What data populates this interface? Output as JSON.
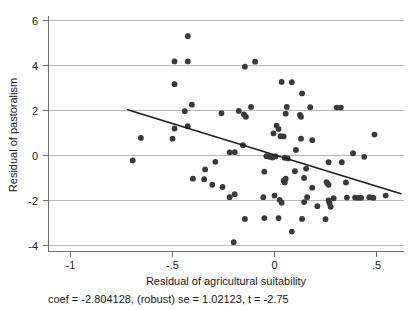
{
  "chart_data": {
    "type": "scatter",
    "title": "",
    "xlabel": "Residual of agricultural suitability",
    "ylabel": "Residual of pastoralism",
    "xlim": [
      -1.06,
      0.68
    ],
    "ylim": [
      -4.3,
      6.3
    ],
    "xticks": [
      -1,
      -0.5,
      0,
      0.5
    ],
    "xticklabels": [
      "-1",
      "-.5",
      "0",
      ".5"
    ],
    "yticks": [
      -4,
      -2,
      0,
      2,
      4,
      6
    ],
    "yticklabels": [
      "-4",
      "-2",
      "0",
      "2",
      "4",
      "6"
    ],
    "grid": "horizontal",
    "legend": "none",
    "annotation": "coef = -2.804128, (robust) se = 1.02123, t = -2.75",
    "fit_line": {
      "label": "linear fit",
      "slope": -2.804128,
      "x_start": -0.72,
      "y_start": 2.03,
      "x_end": 0.62,
      "y_end": -1.7
    },
    "point_color": "#3a3a3a",
    "gridline_color": "#b9b9b9",
    "axis_color": "#6e6e6e",
    "points": [
      [
        -0.425,
        5.3
      ],
      [
        -0.49,
        4.18
      ],
      [
        -0.425,
        4.18
      ],
      [
        -0.145,
        3.95
      ],
      [
        -0.095,
        4.17
      ],
      [
        -0.49,
        3.17
      ],
      [
        0.035,
        3.27
      ],
      [
        0.085,
        3.26
      ],
      [
        0.135,
        2.76
      ],
      [
        -0.405,
        2.26
      ],
      [
        -0.44,
        1.97
      ],
      [
        0.06,
        2.16
      ],
      [
        0.175,
        2.15
      ],
      [
        -0.115,
        2.16
      ],
      [
        0.305,
        2.13
      ],
      [
        0.325,
        2.13
      ],
      [
        -0.26,
        1.88
      ],
      [
        -0.175,
        1.98
      ],
      [
        -0.15,
        1.83
      ],
      [
        -0.14,
        1.72
      ],
      [
        0.055,
        1.86
      ],
      [
        0.125,
        1.8
      ],
      [
        0.13,
        1.72
      ],
      [
        -0.49,
        1.2
      ],
      [
        -0.425,
        1.3
      ],
      [
        0.01,
        1.33
      ],
      [
        0.02,
        1.18
      ],
      [
        -0.5,
        0.75
      ],
      [
        -0.655,
        0.78
      ],
      [
        -0.005,
        0.98
      ],
      [
        0.03,
        0.86
      ],
      [
        0.045,
        0.85
      ],
      [
        0.13,
        0.75
      ],
      [
        0.185,
        0.68
      ],
      [
        0.49,
        0.93
      ],
      [
        -0.155,
        0.46
      ],
      [
        0.105,
        0.25
      ],
      [
        -0.22,
        0.14
      ],
      [
        -0.195,
        0.15
      ],
      [
        -0.04,
        -0.03
      ],
      [
        -0.025,
        -0.06
      ],
      [
        -0.01,
        -0.09
      ],
      [
        0.005,
        -0.04
      ],
      [
        0.05,
        -0.1
      ],
      [
        0.065,
        -0.13
      ],
      [
        0.385,
        0.1
      ],
      [
        0.44,
        -0.06
      ],
      [
        -0.695,
        -0.22
      ],
      [
        -0.29,
        -0.28
      ],
      [
        0.265,
        -0.3
      ],
      [
        0.33,
        -0.3
      ],
      [
        -0.34,
        -0.62
      ],
      [
        0.155,
        -0.58
      ],
      [
        -0.05,
        -0.72
      ],
      [
        0.1,
        -0.7
      ],
      [
        -0.4,
        -1.03
      ],
      [
        -0.345,
        -1.05
      ],
      [
        0.055,
        -1.03
      ],
      [
        0.145,
        -1.0
      ],
      [
        0.045,
        -1.12
      ],
      [
        0.05,
        -1.2
      ],
      [
        0.255,
        -1.18
      ],
      [
        0.26,
        -1.25
      ],
      [
        0.265,
        -1.3
      ],
      [
        0.35,
        -1.2
      ],
      [
        -0.305,
        -1.3
      ],
      [
        -0.255,
        -1.4
      ],
      [
        0.185,
        -1.43
      ],
      [
        -0.195,
        -1.72
      ],
      [
        -0.22,
        -1.85
      ],
      [
        -0.055,
        -1.85
      ],
      [
        0.0,
        -1.78
      ],
      [
        0.16,
        -1.85
      ],
      [
        0.29,
        -1.9
      ],
      [
        0.355,
        -1.87
      ],
      [
        0.395,
        -1.87
      ],
      [
        0.41,
        -1.88
      ],
      [
        0.425,
        -1.88
      ],
      [
        0.465,
        -1.85
      ],
      [
        0.485,
        -1.88
      ],
      [
        0.545,
        -1.78
      ],
      [
        0.025,
        -1.97
      ],
      [
        0.035,
        -2.1
      ],
      [
        0.145,
        -2.07
      ],
      [
        0.21,
        -2.25
      ],
      [
        0.265,
        -2.0
      ],
      [
        0.27,
        -2.12
      ],
      [
        0.275,
        -2.28
      ],
      [
        -0.145,
        -2.82
      ],
      [
        -0.05,
        -2.78
      ],
      [
        0.02,
        -2.78
      ],
      [
        0.135,
        -2.82
      ],
      [
        0.25,
        -2.83
      ],
      [
        0.085,
        -3.38
      ],
      [
        -0.2,
        -3.85
      ]
    ]
  },
  "caption": {
    "text": "coef = -2.804128, (robust) se = 1.02123, t = -2.75"
  }
}
